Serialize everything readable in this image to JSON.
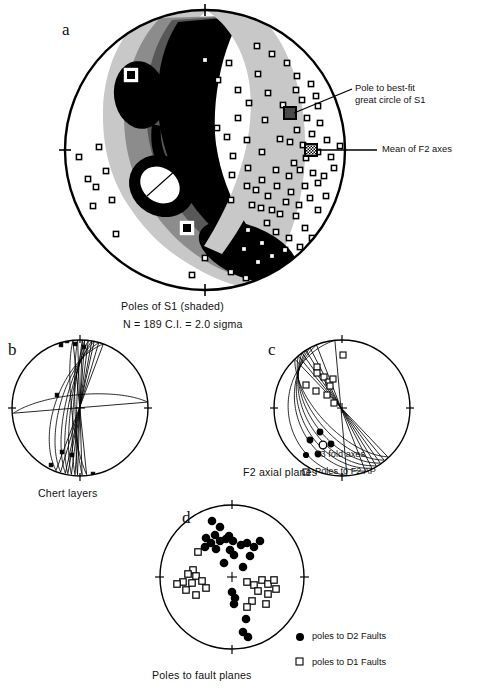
{
  "figure": {
    "background": "#ffffff",
    "ink": "#111111"
  },
  "panel_a": {
    "letter": "a",
    "caption": "Poles of S1 (shaded)",
    "stats": "N = 189    C.I. = 2.0 sigma",
    "annotation_1": "Pole to best-fit",
    "annotation_1b": "great circle of S1",
    "annotation_2": "Mean of F2 axes",
    "net": {
      "cx": 205,
      "cy": 150,
      "r": 140
    },
    "contour_levels": [
      "#c9c9c9",
      "#8f8f8f",
      "#5a5a5a",
      "#000000",
      "#ffffff"
    ],
    "maxima_markers": [
      {
        "x": 131,
        "y": 75,
        "type": "boxed-square"
      },
      {
        "x": 187,
        "y": 228,
        "type": "boxed-square"
      }
    ],
    "special_markers": [
      {
        "x": 290,
        "y": 113,
        "type": "filled-square",
        "label": "pole-to-best-fit-great-circle-of-s1"
      },
      {
        "x": 311,
        "y": 150,
        "type": "hatched-square",
        "label": "mean-of-f2-axes"
      }
    ],
    "poles": [
      [
        79,
        157
      ],
      [
        88,
        179
      ],
      [
        96,
        187
      ],
      [
        93,
        206
      ],
      [
        106,
        171
      ],
      [
        112,
        200
      ],
      [
        99,
        147
      ],
      [
        116,
        234
      ],
      [
        257,
        46
      ],
      [
        272,
        54
      ],
      [
        287,
        63
      ],
      [
        297,
        76
      ],
      [
        296,
        90
      ],
      [
        283,
        105
      ],
      [
        268,
        93
      ],
      [
        258,
        74
      ],
      [
        311,
        84
      ],
      [
        316,
        96
      ],
      [
        302,
        100
      ],
      [
        318,
        106
      ],
      [
        307,
        118
      ],
      [
        320,
        123
      ],
      [
        297,
        130
      ],
      [
        312,
        134
      ],
      [
        280,
        139
      ],
      [
        290,
        142
      ],
      [
        303,
        145
      ],
      [
        318,
        152
      ],
      [
        306,
        158
      ],
      [
        294,
        163
      ],
      [
        327,
        140
      ],
      [
        331,
        157
      ],
      [
        265,
        120
      ],
      [
        249,
        103
      ],
      [
        238,
        90
      ],
      [
        262,
        152
      ],
      [
        247,
        140
      ],
      [
        233,
        156
      ],
      [
        276,
        170
      ],
      [
        289,
        176
      ],
      [
        262,
        180
      ],
      [
        248,
        168
      ],
      [
        300,
        170
      ],
      [
        313,
        173
      ],
      [
        277,
        186
      ],
      [
        291,
        192
      ],
      [
        268,
        196
      ],
      [
        256,
        190
      ],
      [
        305,
        186
      ],
      [
        318,
        183
      ],
      [
        286,
        202
      ],
      [
        299,
        205
      ],
      [
        272,
        210
      ],
      [
        310,
        198
      ],
      [
        324,
        176
      ],
      [
        238,
        118
      ],
      [
        247,
        186
      ],
      [
        232,
        175
      ],
      [
        261,
        208
      ],
      [
        280,
        214
      ],
      [
        296,
        216
      ],
      [
        267,
        223
      ],
      [
        252,
        205
      ],
      [
        318,
        210
      ],
      [
        276,
        232
      ],
      [
        289,
        238
      ],
      [
        262,
        243
      ],
      [
        248,
        230
      ],
      [
        305,
        228
      ],
      [
        231,
        200
      ],
      [
        244,
        249
      ],
      [
        258,
        262
      ],
      [
        272,
        256
      ],
      [
        285,
        250
      ],
      [
        227,
        137
      ],
      [
        217,
        128
      ],
      [
        205,
        258
      ],
      [
        192,
        275
      ],
      [
        231,
        272
      ],
      [
        246,
        278
      ],
      [
        300,
        247
      ],
      [
        312,
        238
      ],
      [
        326,
        196
      ],
      [
        334,
        168
      ],
      [
        340,
        146
      ],
      [
        218,
        80
      ],
      [
        205,
        60
      ],
      [
        229,
        63
      ]
    ]
  },
  "panel_b": {
    "letter": "b",
    "caption": "Chert layers",
    "net": {
      "cx": 80,
      "cy": 408,
      "r": 68
    },
    "great_circles": [
      {
        "strike": 78,
        "dip": 72
      },
      {
        "strike": 80,
        "dip": 76
      },
      {
        "strike": 83,
        "dip": 79
      },
      {
        "strike": 86,
        "dip": 82
      },
      {
        "strike": 74,
        "dip": 66
      },
      {
        "strike": 70,
        "dip": 60
      },
      {
        "strike": 88,
        "dip": 86
      },
      {
        "strike": 92,
        "dip": 84
      },
      {
        "strike": 96,
        "dip": 80
      },
      {
        "strike": 5,
        "dip": 74
      }
    ],
    "points": [
      [
        61,
        345
      ],
      [
        67,
        341
      ],
      [
        75,
        344
      ],
      [
        84,
        347
      ],
      [
        51,
        465
      ],
      [
        62,
        452
      ],
      [
        72,
        455
      ],
      [
        57,
        395
      ],
      [
        93,
        474
      ]
    ]
  },
  "panel_c": {
    "letter": "c",
    "caption": "F2 axial planes",
    "net": {
      "cx": 342,
      "cy": 408,
      "r": 68
    },
    "legend": [
      {
        "symbol": "filled-circle",
        "label": "F3 fold axes"
      },
      {
        "symbol": "open-square",
        "label": "Poles to F2 AP"
      }
    ],
    "great_circles": [
      {
        "strike": 118,
        "dip": 40
      },
      {
        "strike": 122,
        "dip": 46
      },
      {
        "strike": 126,
        "dip": 52
      },
      {
        "strike": 130,
        "dip": 58
      },
      {
        "strike": 134,
        "dip": 64
      },
      {
        "strike": 112,
        "dip": 34
      },
      {
        "strike": 96,
        "dip": 22
      }
    ],
    "poles_to_f2_ap": [
      [
        317,
        367
      ],
      [
        317,
        373
      ],
      [
        324,
        377
      ],
      [
        329,
        382
      ],
      [
        333,
        379
      ],
      [
        330,
        386
      ],
      [
        316,
        391
      ],
      [
        327,
        395
      ],
      [
        306,
        385
      ],
      [
        343,
        355
      ],
      [
        334,
        403
      ]
    ],
    "f3_fold_axes": [
      [
        320,
        432
      ],
      [
        310,
        440
      ],
      [
        331,
        444
      ],
      [
        318,
        454
      ]
    ],
    "mean_f3_axis": [
      323,
      445
    ]
  },
  "panel_d": {
    "letter": "d",
    "caption": "Poles to fault planes",
    "net": {
      "cx": 232,
      "cy": 577,
      "r": 72
    },
    "legend": [
      {
        "symbol": "filled-circle",
        "label": "poles to D2 Faults"
      },
      {
        "symbol": "open-square",
        "label": "poles to D1 Faults"
      }
    ],
    "d2_faults": [
      [
        212,
        521
      ],
      [
        220,
        527
      ],
      [
        215,
        535
      ],
      [
        206,
        538
      ],
      [
        220,
        541
      ],
      [
        226,
        539
      ],
      [
        229,
        536
      ],
      [
        233,
        541
      ],
      [
        211,
        543
      ],
      [
        205,
        547
      ],
      [
        216,
        549
      ],
      [
        241,
        545
      ],
      [
        247,
        543
      ],
      [
        254,
        547
      ],
      [
        260,
        541
      ],
      [
        230,
        550
      ],
      [
        234,
        555
      ],
      [
        250,
        556
      ],
      [
        224,
        563
      ],
      [
        243,
        567
      ],
      [
        232,
        592
      ],
      [
        235,
        598
      ],
      [
        234,
        604
      ],
      [
        246,
        619
      ],
      [
        243,
        632
      ],
      [
        248,
        637
      ]
    ],
    "d1_faults": [
      [
        198,
        552
      ],
      [
        193,
        570
      ],
      [
        188,
        574
      ],
      [
        196,
        576
      ],
      [
        183,
        582
      ],
      [
        192,
        583
      ],
      [
        202,
        581
      ],
      [
        177,
        584
      ],
      [
        186,
        590
      ],
      [
        196,
        595
      ],
      [
        206,
        588
      ],
      [
        247,
        582
      ],
      [
        254,
        585
      ],
      [
        262,
        580
      ],
      [
        268,
        584
      ],
      [
        274,
        580
      ],
      [
        258,
        591
      ],
      [
        268,
        594
      ],
      [
        276,
        589
      ],
      [
        252,
        601
      ],
      [
        266,
        604
      ],
      [
        247,
        607
      ]
    ]
  }
}
